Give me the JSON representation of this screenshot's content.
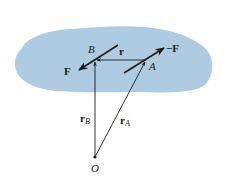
{
  "figure": {
    "body_color": "#aecbe2",
    "line_color": "#1a1a1a",
    "labels": {
      "force": "F",
      "neg_force": "−F",
      "r": "r",
      "point_a": "A",
      "point_b": "B",
      "origin": "O",
      "r_b_main": "r",
      "r_b_sub": "B",
      "r_a_main": "r",
      "r_a_sub": "A"
    }
  }
}
